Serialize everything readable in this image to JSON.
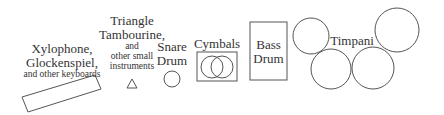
{
  "diagram": {
    "stroke_color": "#555555",
    "text_color": "#333333",
    "instruments": {
      "xylophone": {
        "line1": "Xylophone,",
        "line2": "Glockenspiel,",
        "line3": "and other keyboards",
        "shape": "tilted-rectangle"
      },
      "small": {
        "line1": "Triangle",
        "line2": "Tambourine,",
        "line3": "and",
        "line4": "other small",
        "line5": "instruments",
        "shape": "triangle"
      },
      "snare": {
        "line1": "Snare",
        "line2": "Drum",
        "shape": "circle"
      },
      "cymbals": {
        "label": "Cymbals",
        "shape": "box-with-two-overlapping-circles"
      },
      "bass": {
        "line1": "Bass",
        "line2": "Drum",
        "shape": "tall-rectangle"
      },
      "timpani": {
        "label": "Timpani",
        "count": 4,
        "shape": "four-circles"
      }
    }
  }
}
